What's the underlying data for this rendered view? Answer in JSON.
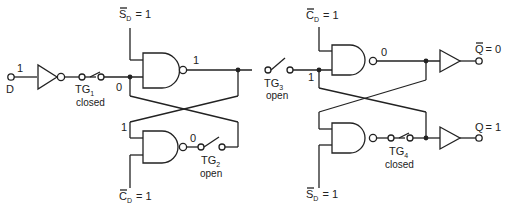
{
  "diagram": {
    "type": "CMOS master-slave D flip-flop with transmission gates",
    "input": {
      "name": "D",
      "value": "1"
    },
    "master": {
      "set_label": "S",
      "set_sub": "D",
      "set_value": "= 1",
      "clear_label": "C",
      "clear_sub": "D",
      "clear_value": "= 1",
      "node_in": "0",
      "nand_top_out": "1",
      "cross_in": "1",
      "nand_bottom_out": "0"
    },
    "slave": {
      "clear_label": "C",
      "clear_sub": "D",
      "clear_value": "= 1",
      "set_label": "S",
      "set_sub": "D",
      "set_value": "= 1",
      "node_in": "1",
      "nand_top_out": "0"
    },
    "gates": [
      {
        "name": "TG",
        "sub": "1",
        "state": "closed"
      },
      {
        "name": "TG",
        "sub": "2",
        "state": "open"
      },
      {
        "name": "TG",
        "sub": "3",
        "state": "open"
      },
      {
        "name": "TG",
        "sub": "4",
        "state": "closed"
      }
    ],
    "outputs": [
      {
        "label": "Q",
        "value": "= 0",
        "inverted": true
      },
      {
        "label": "Q",
        "value": "= 1",
        "inverted": false
      }
    ]
  }
}
